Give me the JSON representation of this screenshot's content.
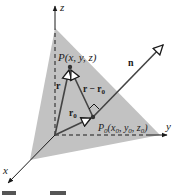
{
  "figure": {
    "caption_partial": "Figure 2.3.3",
    "axes": {
      "x_label": "x",
      "y_label": "y",
      "z_label": "z"
    },
    "points": {
      "P_label": "P(x, y, z)",
      "P0_label_main": "P",
      "P0_label_sub": "0",
      "P0_label_coords": "(x",
      "P0_label_rest": ", y",
      "P0_label_rest2": ", z",
      "P0_label_close": ")"
    },
    "vectors": {
      "n": "n",
      "r": "r",
      "r_minus_r0": "r − r",
      "r0": "r",
      "sub0": "0"
    },
    "colors": {
      "plane": "#bdbdbd",
      "ink": "#1a1a1a"
    }
  }
}
